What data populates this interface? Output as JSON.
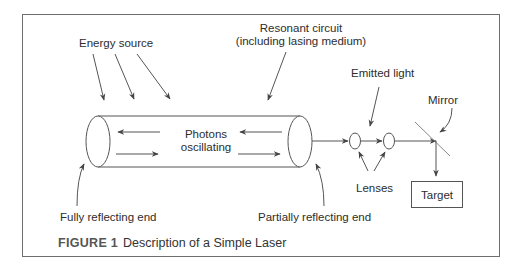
{
  "figure": {
    "caption_label": "FIGURE 1",
    "caption_text": "Description of a Simple Laser"
  },
  "labels": {
    "energy_source": "Energy source",
    "resonant_circuit_line1": "Resonant circuit",
    "resonant_circuit_line2": "(including lasing medium)",
    "photons_line1": "Photons",
    "photons_line2": "oscillating",
    "emitted_light": "Emitted light",
    "mirror": "Mirror",
    "lenses": "Lenses",
    "target": "Target",
    "fully_reflecting_end": "Fully reflecting end",
    "partially_reflecting_end": "Partially reflecting end"
  },
  "colors": {
    "line": "#555555",
    "text": "#2d2d2d",
    "frame": "#6e6e6e"
  }
}
